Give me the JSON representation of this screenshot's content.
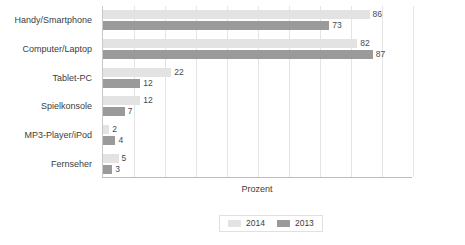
{
  "chart_data": {
    "type": "bar",
    "orientation": "horizontal",
    "title": "",
    "xlabel": "Prozent",
    "ylabel": "",
    "xlim": [
      0,
      100
    ],
    "grid": true,
    "legend_position": "bottom",
    "categories": [
      "Handy/Smartphone",
      "Computer/Laptop",
      "Tablet-PC",
      "Spielkonsole",
      "MP3-Player/iPod",
      "Fernseher"
    ],
    "series": [
      {
        "name": "2014",
        "color": "#e3e3e3",
        "values": [
          86,
          82,
          22,
          12,
          2,
          5
        ]
      },
      {
        "name": "2013",
        "color": "#9a9a9a",
        "values": [
          73,
          87,
          12,
          7,
          4,
          3
        ]
      }
    ],
    "gridline_values": [
      10,
      20,
      30,
      40,
      50,
      60,
      70,
      80,
      90,
      100
    ]
  },
  "legend": {
    "items": [
      {
        "label": "2014"
      },
      {
        "label": "2013"
      }
    ]
  },
  "axis": {
    "x_title": "Prozent"
  }
}
